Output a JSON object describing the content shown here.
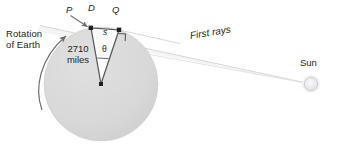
{
  "figure": {
    "background_color": "#ffffff"
  },
  "labels": {
    "rotation": "Rotation\nof Earth",
    "rotation_line1": "Rotation",
    "rotation_line2": "of Earth",
    "radius": "2710\nmiles",
    "radius_line1": "2710",
    "radius_line2": "miles",
    "point_p": "P",
    "point_d": "D",
    "point_q": "Q",
    "arc_s": "s",
    "angle_theta": "θ",
    "first_rays": "First rays",
    "sun": "Sun"
  },
  "colors": {
    "earth_fill": "#d9d9d9",
    "earth_stroke": "#cccccc",
    "triangle_stroke": "#58585b",
    "triangle_fill": "#ffffff",
    "ray_stroke": "#d4d4d6",
    "ray_fill": "#f2f2f3",
    "sun_fill": "#e8e8ea",
    "sun_stroke": "#cfcfd2",
    "text": "#231f20",
    "arrow": "#6d6e71"
  },
  "geometry": {
    "earth_center": {
      "x": 101,
      "y": 84
    },
    "earth_radius": 57,
    "point_d": {
      "x": 91,
      "y": 28
    },
    "point_q": {
      "x": 119,
      "y": 30
    },
    "sun_center": {
      "x": 311,
      "y": 84
    },
    "sun_radius": 7
  },
  "icons": {
    "rotation_arrow": "curved-arrow-icon",
    "pointer_arrow": "pointer-arrow-icon",
    "right_angle": "right-angle-mark-icon"
  }
}
